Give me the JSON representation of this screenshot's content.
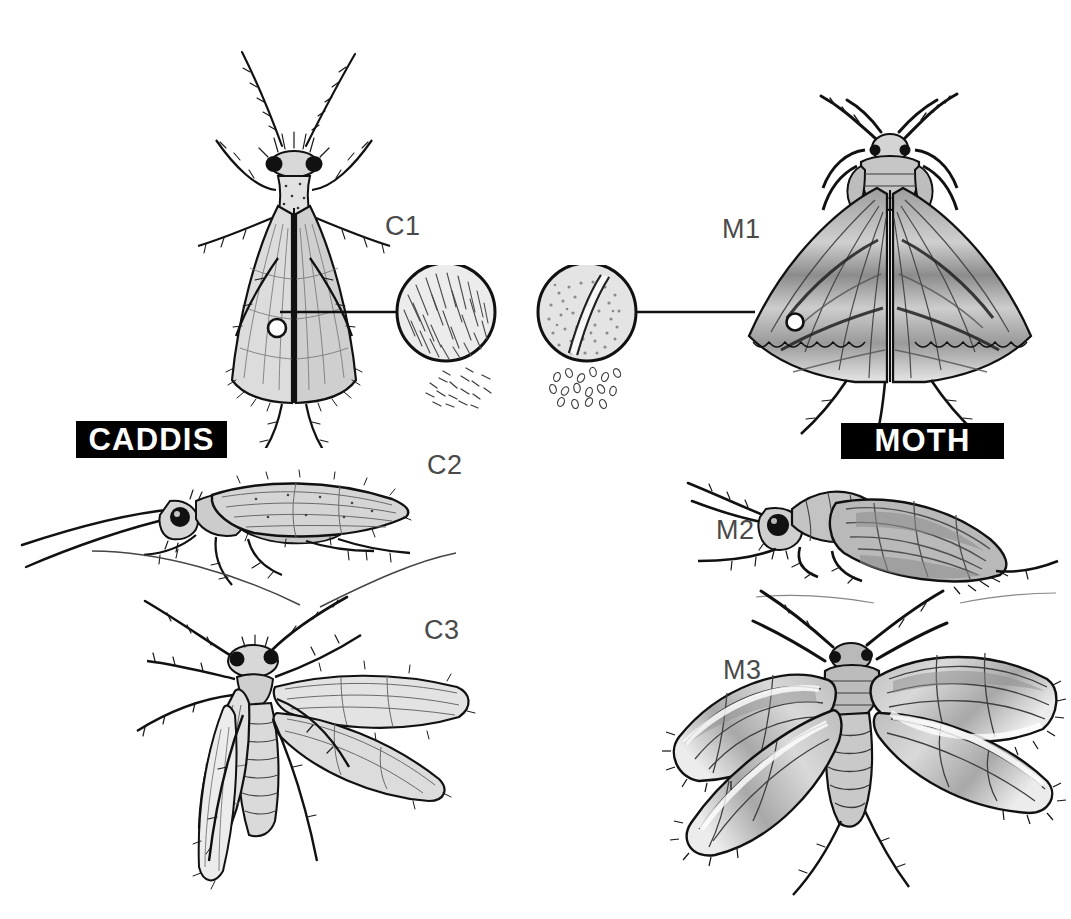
{
  "plate": {
    "title": "Caddis versus Moth comparison plate",
    "background_color": "#ffffff",
    "ink_color": "#111111",
    "banner_background": "#000000",
    "banner_text_color": "#ffffff",
    "code_label_color": "#4a4a4a"
  },
  "banners": {
    "caddis": "CADDIS",
    "moth": "MOTH"
  },
  "labels": {
    "c1": "C1",
    "c2": "C2",
    "c3": "C3",
    "m1": "M1",
    "m2": "M2",
    "m3": "M3"
  },
  "figures": [
    {
      "code": "C1",
      "side": "caddis",
      "view": "dorsal-at-rest",
      "description": "Caddisfly seen from above with long thread-like antennae held forward and tent-like roof-shaped wings folded over the body"
    },
    {
      "code": "C2",
      "side": "caddis",
      "view": "lateral-at-rest",
      "description": "Caddisfly side view with extremely long antennae sweeping forward and hairy tent-shaped wings"
    },
    {
      "code": "C3",
      "side": "caddis",
      "view": "wings-spread",
      "description": "Caddisfly with wings spread open showing narrow hairy wings and segmented abdomen"
    },
    {
      "code": "M1",
      "side": "moth",
      "view": "dorsal-at-rest",
      "description": "Moth seen from above with short feathery antennae and broad triangular scaled wings"
    },
    {
      "code": "M2",
      "side": "moth",
      "view": "lateral-at-rest",
      "description": "Moth side view with short antennae and broad scaled wings held over the body"
    },
    {
      "code": "M3",
      "side": "moth",
      "view": "wings-spread",
      "description": "Moth with wings spread open showing broad scaled wings and stout abdomen"
    }
  ],
  "magnifiers": [
    {
      "id": "caddis-wing-detail",
      "side": "caddis",
      "points_to": "C1 wing surface",
      "shows": "hairs (setae)",
      "fallout_caption": "loose hairs"
    },
    {
      "id": "moth-wing-detail",
      "side": "moth",
      "points_to": "M1 wing surface",
      "shows": "scales",
      "fallout_caption": "loose scales"
    }
  ]
}
